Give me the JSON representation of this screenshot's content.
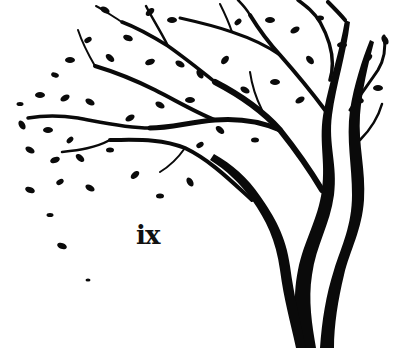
{
  "image": {
    "description": "Black silhouette of a tree with leaves blowing to the left",
    "background_color": "#ffffff",
    "ink_color": "#0a0a0a"
  },
  "page": {
    "number_label": "ix"
  }
}
